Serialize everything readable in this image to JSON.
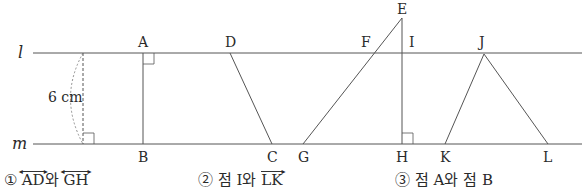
{
  "diagram": {
    "lines": [
      {
        "name": "l",
        "y": 53
      },
      {
        "name": "m",
        "y": 144
      }
    ],
    "distance_label": "6 cm",
    "points": {
      "A": "A",
      "B": "B",
      "C": "C",
      "D": "D",
      "E": "E",
      "F": "F",
      "G": "G",
      "H": "H",
      "I": "I",
      "J": "J",
      "K": "K",
      "L": "L"
    },
    "line_labels": {
      "l": "l",
      "m": "m"
    }
  },
  "options": [
    {
      "num": "①",
      "pre": "",
      "seg1": "AD",
      "mid": "와 ",
      "seg2": "GH",
      "post": ""
    },
    {
      "num": "②",
      "pre": "점 I와 ",
      "seg2": "LK"
    },
    {
      "num": "③",
      "text": "점 A와 점 B"
    }
  ]
}
